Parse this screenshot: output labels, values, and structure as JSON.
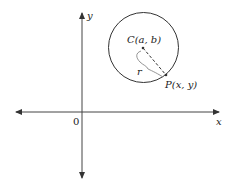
{
  "diagram": {
    "axes": {
      "x_label": "x",
      "y_label": "y",
      "origin_label": "0"
    },
    "circle": {
      "center_label": "C(a, b)",
      "point_label": "P(x, y)",
      "radius_label": "r"
    },
    "colors": {
      "stroke": "#333333",
      "background": "#ffffff"
    }
  }
}
